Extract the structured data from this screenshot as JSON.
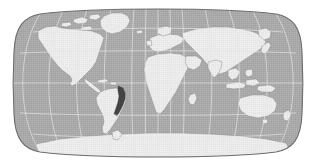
{
  "figure": {
    "kind": "world-map",
    "projection": "Robinson",
    "width": 316,
    "height": 166,
    "background_color": "#ffffff"
  },
  "map": {
    "ocean_color": "#a9a9a9",
    "land_color": "#ededed",
    "land_stroke_color": "#8a8a8a",
    "graticule_color": "#e8e8e8",
    "border_color": "#6e6e6e",
    "highlight_color": "#444444",
    "graticule": {
      "meridian_interval_deg": 30,
      "parallel_interval_deg": 30,
      "meridians": [
        -180,
        -150,
        -120,
        -90,
        -60,
        -30,
        0,
        30,
        60,
        90,
        120,
        150,
        180
      ],
      "parallels": [
        -60,
        -30,
        0,
        30,
        60
      ],
      "equator_label": "0",
      "prime_meridian_label": "0"
    },
    "bounds": {
      "left": 14,
      "top": 9,
      "right": 303,
      "bottom": 157
    },
    "highlight_region": {
      "name": "eastern-brazil-coast",
      "color": "#444444"
    },
    "continents": [
      "North America",
      "South America",
      "Europe",
      "Africa",
      "Asia",
      "Australia",
      "Antarctica",
      "Greenland"
    ]
  }
}
